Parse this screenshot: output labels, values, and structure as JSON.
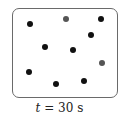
{
  "diagram": {
    "caption_var": "t",
    "caption_rest": " = 30 s",
    "particles": [
      {
        "x": 30,
        "y": 24,
        "color": "#111111"
      },
      {
        "x": 66,
        "y": 19,
        "color": "#555555"
      },
      {
        "x": 101,
        "y": 19,
        "color": "#111111"
      },
      {
        "x": 91,
        "y": 35,
        "color": "#111111"
      },
      {
        "x": 45,
        "y": 47,
        "color": "#111111"
      },
      {
        "x": 73,
        "y": 50,
        "color": "#111111"
      },
      {
        "x": 102,
        "y": 63,
        "color": "#555555"
      },
      {
        "x": 29,
        "y": 72,
        "color": "#111111"
      },
      {
        "x": 56,
        "y": 84,
        "color": "#111111"
      },
      {
        "x": 84,
        "y": 81,
        "color": "#111111"
      }
    ]
  }
}
